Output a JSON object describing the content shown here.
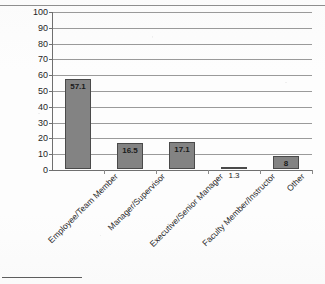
{
  "chart_data": {
    "type": "bar",
    "title": "",
    "xlabel": "",
    "ylabel": "",
    "categories": [
      "Employee/Team Member",
      "Manager/Supervisor",
      "Executive/Senior Manager",
      "Faculty Member/Instructor",
      "Other"
    ],
    "values": [
      57.1,
      16.5,
      17.1,
      1.3,
      8
    ],
    "value_labels": [
      "57.1",
      "16.5",
      "17.1",
      "1.3",
      "8"
    ],
    "ylim": [
      0,
      100
    ],
    "ytick_step": 10,
    "ytick_labels": [
      "100",
      "90",
      "80",
      "70",
      "60",
      "50",
      "40",
      "30",
      "20",
      "10",
      "0"
    ],
    "grid": true,
    "legend": false,
    "orientation": "vertical",
    "bar_color": "#838383",
    "bar_border_color": "#4a4a4a",
    "gridline_color": "#9a9a9a",
    "axis_color": "#6f6f6f",
    "label_rotation_degrees": -45
  },
  "page": {
    "cut_off_title": "",
    "footnote_rule": ""
  }
}
